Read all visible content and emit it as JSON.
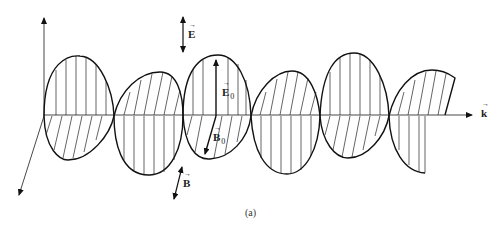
{
  "figure": {
    "caption": "(a)",
    "labels": {
      "E_field": "E",
      "B_field": "B",
      "E_amplitude": "E",
      "E_amplitude_sub": "0",
      "B_amplitude": "B",
      "B_amplitude_sub": "0",
      "propagation": "k"
    },
    "colors": {
      "stroke": "#111111",
      "hatch": "#222222",
      "background": "#ffffff"
    }
  }
}
